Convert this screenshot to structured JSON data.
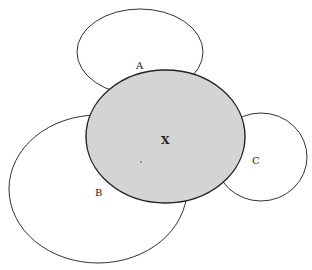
{
  "diagram": {
    "type": "overlapping-ellipses",
    "colors": {
      "stroke": "#333333",
      "outer_fill": "#ffffff",
      "center_fill": "#d4d4d4",
      "background": "#ffffff"
    },
    "ellipses": [
      {
        "id": "A",
        "label": "A",
        "cx": 140,
        "cy": 52,
        "rx": 63,
        "ry": 43,
        "label_x": 136,
        "label_y": 69
      },
      {
        "id": "B",
        "label": "B",
        "cx": 98,
        "cy": 189,
        "rx": 89,
        "ry": 74,
        "label_x": 95,
        "label_y": 196
      },
      {
        "id": "C",
        "label": "C",
        "cx": 261,
        "cy": 157,
        "rx": 46,
        "ry": 44,
        "label_x": 252,
        "label_y": 164
      },
      {
        "id": "X",
        "label": "X",
        "cx": 165.5,
        "cy": 136.5,
        "rx": 79.5,
        "ry": 66.5,
        "label_x": 161,
        "label_y": 144,
        "shaded": true
      }
    ]
  }
}
